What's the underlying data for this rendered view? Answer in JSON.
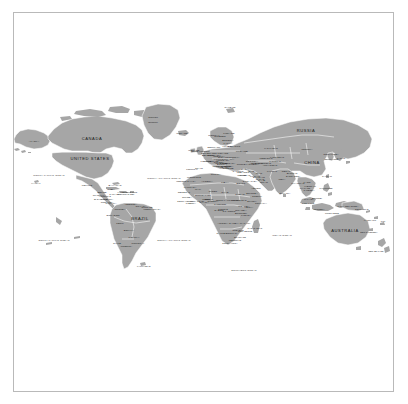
{
  "document": {
    "type": "world-political-map",
    "title": "World Map",
    "projection": "Mercator-like equirectangular"
  },
  "style": {
    "page_background": "#ffffff",
    "frame_border_color": "#b9b9b9",
    "land_fill": "#a6a6a6",
    "ocean_fill": "#ffffff",
    "country_border_color": "#ffffff",
    "label_color": "#1a1a1a"
  },
  "major_labels": [
    {
      "name": "CANADA",
      "x": 78,
      "y": 48
    },
    {
      "name": "UNITED STATES",
      "x": 76,
      "y": 68
    },
    {
      "name": "RUSSIA",
      "x": 292,
      "y": 40
    },
    {
      "name": "CHINA",
      "x": 298,
      "y": 72
    },
    {
      "name": "BRAZIL",
      "x": 126,
      "y": 128
    },
    {
      "name": "AUSTRALIA",
      "x": 331,
      "y": 140
    }
  ],
  "mid_labels": [
    {
      "name": "Greenland",
      "x": 139,
      "y": 26
    },
    {
      "name": "(Denmark)",
      "x": 139,
      "y": 31
    },
    {
      "name": "MONGOLIA",
      "x": 293,
      "y": 58
    },
    {
      "name": "KAZAKHSTAN",
      "x": 257,
      "y": 57
    },
    {
      "name": "INDIA",
      "x": 268,
      "y": 88
    },
    {
      "name": "ALGERIA",
      "x": 193,
      "y": 90
    },
    {
      "name": "LIBYA",
      "x": 211,
      "y": 91
    },
    {
      "name": "EGYPT",
      "x": 227,
      "y": 92
    },
    {
      "name": "SUDAN",
      "x": 226,
      "y": 103
    },
    {
      "name": "CHAD",
      "x": 211,
      "y": 101
    },
    {
      "name": "NIGER",
      "x": 199,
      "y": 100
    },
    {
      "name": "MALI",
      "x": 184,
      "y": 98
    },
    {
      "name": "NIGERIA",
      "x": 199,
      "y": 110
    },
    {
      "name": "ETHIOPIA",
      "x": 238,
      "y": 110
    },
    {
      "name": "D.R. CONGO",
      "x": 215,
      "y": 120
    },
    {
      "name": "ANGOLA",
      "x": 209,
      "y": 132
    },
    {
      "name": "TANZANIA",
      "x": 232,
      "y": 124
    },
    {
      "name": "ZAMBIA",
      "x": 220,
      "y": 132
    },
    {
      "name": "NAMIBIA",
      "x": 208,
      "y": 142
    },
    {
      "name": "BOTSWANA",
      "x": 218,
      "y": 142
    },
    {
      "name": "SOUTH AFRICA",
      "x": 216,
      "y": 152
    },
    {
      "name": "MADAGASCAR",
      "x": 241,
      "y": 137
    },
    {
      "name": "ARGENTINA",
      "x": 112,
      "y": 155
    },
    {
      "name": "CHILE",
      "x": 103,
      "y": 152
    },
    {
      "name": "PERU",
      "x": 106,
      "y": 132
    },
    {
      "name": "BOLIVIA",
      "x": 115,
      "y": 139
    },
    {
      "name": "COLOMBIA",
      "x": 106,
      "y": 118
    },
    {
      "name": "VENEZUELA",
      "x": 117,
      "y": 113
    },
    {
      "name": "MEXICO",
      "x": 73,
      "y": 94
    },
    {
      "name": "ALASKA",
      "x": 20,
      "y": 50
    },
    {
      "name": "IRAN",
      "x": 245,
      "y": 82
    },
    {
      "name": "SAUDI ARABIA",
      "x": 236,
      "y": 90
    },
    {
      "name": "IRAQ",
      "x": 237,
      "y": 80
    },
    {
      "name": "TURKEY",
      "x": 228,
      "y": 73
    },
    {
      "name": "PAKISTAN",
      "x": 258,
      "y": 80
    },
    {
      "name": "AFGHANISTAN",
      "x": 256,
      "y": 74
    },
    {
      "name": "INDONESIA",
      "x": 305,
      "y": 118
    },
    {
      "name": "PAPUA NEW GUINEA",
      "x": 334,
      "y": 115
    },
    {
      "name": "JAPAN",
      "x": 327,
      "y": 67
    },
    {
      "name": "THAILAND",
      "x": 291,
      "y": 97
    },
    {
      "name": "MYANMAR",
      "x": 284,
      "y": 92
    },
    {
      "name": "VIETNAM",
      "x": 296,
      "y": 95
    },
    {
      "name": "PHILIPPINES",
      "x": 312,
      "y": 97
    },
    {
      "name": "MALAYSIA",
      "x": 295,
      "y": 108
    },
    {
      "name": "NEW ZEALAND",
      "x": 362,
      "y": 160
    },
    {
      "name": "UKRAINE",
      "x": 228,
      "y": 60
    },
    {
      "name": "SPAIN",
      "x": 185,
      "y": 77
    },
    {
      "name": "FRANCE",
      "x": 192,
      "y": 70
    },
    {
      "name": "GERMANY",
      "x": 200,
      "y": 64
    },
    {
      "name": "POLAND",
      "x": 209,
      "y": 62
    },
    {
      "name": "ITALY",
      "x": 202,
      "y": 75
    },
    {
      "name": "NORWAY",
      "x": 200,
      "y": 44
    },
    {
      "name": "SWEDEN",
      "x": 206,
      "y": 45
    },
    {
      "name": "FINLAND",
      "x": 215,
      "y": 42
    },
    {
      "name": "UNITED KINGDOM",
      "x": 186,
      "y": 60
    },
    {
      "name": "ICELAND",
      "x": 168,
      "y": 42
    },
    {
      "name": "MOROCCO",
      "x": 180,
      "y": 86
    },
    {
      "name": "MAURITANIA",
      "x": 176,
      "y": 96
    },
    {
      "name": "SOMALIA",
      "x": 247,
      "y": 112
    },
    {
      "name": "KENYA",
      "x": 235,
      "y": 116
    },
    {
      "name": "MOZAMBIQUE",
      "x": 231,
      "y": 140
    },
    {
      "name": "ZIMBABWE",
      "x": 224,
      "y": 139
    },
    {
      "name": "CUBA",
      "x": 97,
      "y": 98
    },
    {
      "name": "PARAGUAY",
      "x": 120,
      "y": 146
    },
    {
      "name": "URUGUAY",
      "x": 124,
      "y": 152
    },
    {
      "name": "ECUADOR",
      "x": 99,
      "y": 124
    },
    {
      "name": "UZBEKISTAN",
      "x": 252,
      "y": 67
    },
    {
      "name": "SYRIA",
      "x": 231,
      "y": 78
    },
    {
      "name": "NEPAL",
      "x": 272,
      "y": 80
    },
    {
      "name": "BANGLADESH",
      "x": 279,
      "y": 85
    },
    {
      "name": "SRI LANKA",
      "x": 271,
      "y": 102
    },
    {
      "name": "SOUTH KOREA",
      "x": 318,
      "y": 68
    },
    {
      "name": "NORTH KOREA",
      "x": 317,
      "y": 63
    },
    {
      "name": "TAIWAN",
      "x": 313,
      "y": 85
    },
    {
      "name": "CAMEROON",
      "x": 206,
      "y": 113
    },
    {
      "name": "GHANA",
      "x": 190,
      "y": 111
    },
    {
      "name": "SENEGAL",
      "x": 170,
      "y": 101
    },
    {
      "name": "TUNISIA",
      "x": 202,
      "y": 83
    },
    {
      "name": "GREECE",
      "x": 214,
      "y": 77
    },
    {
      "name": "ROMANIA",
      "x": 214,
      "y": 68
    },
    {
      "name": "BELARUS",
      "x": 220,
      "y": 55
    },
    {
      "name": "PORTUGAL",
      "x": 178,
      "y": 78
    },
    {
      "name": "GUYANA",
      "x": 127,
      "y": 115
    },
    {
      "name": "SURINAME",
      "x": 133,
      "y": 116
    },
    {
      "name": "HONDURAS",
      "x": 91,
      "y": 105
    },
    {
      "name": "GUATEMALA",
      "x": 85,
      "y": 104
    },
    {
      "name": "NICARAGUA",
      "x": 93,
      "y": 108
    },
    {
      "name": "PANAMA",
      "x": 97,
      "y": 112
    },
    {
      "name": "COSTA RICA",
      "x": 93,
      "y": 111
    },
    {
      "name": "HAITI",
      "x": 107,
      "y": 101
    },
    {
      "name": "JAMAICA",
      "x": 101,
      "y": 103
    },
    {
      "name": "PUERTO RICO",
      "x": 116,
      "y": 101
    },
    {
      "name": "ISRAEL",
      "x": 228,
      "y": 84
    },
    {
      "name": "JORDAN",
      "x": 231,
      "y": 84
    },
    {
      "name": "OMAN",
      "x": 250,
      "y": 91
    },
    {
      "name": "YEMEN",
      "x": 242,
      "y": 97
    },
    {
      "name": "U.A.E.",
      "x": 248,
      "y": 89
    },
    {
      "name": "GEORGIA",
      "x": 238,
      "y": 70
    },
    {
      "name": "AZERBAIJAN",
      "x": 242,
      "y": 72
    },
    {
      "name": "TURKMENISTAN",
      "x": 249,
      "y": 72
    },
    {
      "name": "KYRGYZSTAN",
      "x": 263,
      "y": 66
    },
    {
      "name": "TAJIKISTAN",
      "x": 261,
      "y": 70
    },
    {
      "name": "LAOS",
      "x": 293,
      "y": 91
    },
    {
      "name": "CAMBODIA",
      "x": 295,
      "y": 99
    },
    {
      "name": "UGANDA",
      "x": 230,
      "y": 115
    },
    {
      "name": "RWANDA",
      "x": 227,
      "y": 119
    },
    {
      "name": "GABON",
      "x": 205,
      "y": 119
    },
    {
      "name": "CONGO",
      "x": 209,
      "y": 118
    },
    {
      "name": "MALAWI",
      "x": 231,
      "y": 132
    },
    {
      "name": "ERITREA",
      "x": 238,
      "y": 102
    },
    {
      "name": "BURKINA FASO",
      "x": 189,
      "y": 104
    },
    {
      "name": "IVORY COAST",
      "x": 183,
      "y": 110
    },
    {
      "name": "GUINEA",
      "x": 173,
      "y": 106
    },
    {
      "name": "LIBERIA",
      "x": 177,
      "y": 112
    },
    {
      "name": "SIERRA LEONE",
      "x": 171,
      "y": 110
    },
    {
      "name": "BENIN",
      "x": 195,
      "y": 108
    },
    {
      "name": "TOGO",
      "x": 192,
      "y": 108
    },
    {
      "name": "CENTRAL AFRICAN REP.",
      "x": 214,
      "y": 109
    },
    {
      "name": "SOUTH SUDAN",
      "x": 225,
      "y": 109
    },
    {
      "name": "DJIBOUTI",
      "x": 243,
      "y": 105
    },
    {
      "name": "BURUNDI",
      "x": 227,
      "y": 122
    },
    {
      "name": "LESOTHO",
      "x": 221,
      "y": 149
    },
    {
      "name": "SWAZILAND",
      "x": 226,
      "y": 146
    },
    {
      "name": "BELIZE",
      "x": 88,
      "y": 101
    },
    {
      "name": "EL SALVADOR",
      "x": 87,
      "y": 108
    },
    {
      "name": "DOMINICAN REP.",
      "x": 112,
      "y": 103
    },
    {
      "name": "BAHAMAS",
      "x": 101,
      "y": 94
    },
    {
      "name": "FRENCH GUIANA",
      "x": 138,
      "y": 118
    },
    {
      "name": "AUSTRIA",
      "x": 204,
      "y": 68
    },
    {
      "name": "SWITZERLAND",
      "x": 197,
      "y": 70
    },
    {
      "name": "CZECHIA",
      "x": 205,
      "y": 65
    },
    {
      "name": "HUNGARY",
      "x": 209,
      "y": 69
    },
    {
      "name": "SERBIA",
      "x": 211,
      "y": 72
    },
    {
      "name": "BULGARIA",
      "x": 216,
      "y": 72
    },
    {
      "name": "CROATIA",
      "x": 207,
      "y": 72
    },
    {
      "name": "NETHERLANDS",
      "x": 195,
      "y": 62
    },
    {
      "name": "BELGIUM",
      "x": 194,
      "y": 64
    },
    {
      "name": "DENMARK",
      "x": 200,
      "y": 56
    },
    {
      "name": "IRELAND",
      "x": 180,
      "y": 59
    },
    {
      "name": "LITHUANIA",
      "x": 214,
      "y": 55
    },
    {
      "name": "LATVIA",
      "x": 214,
      "y": 52
    },
    {
      "name": "ESTONIA",
      "x": 214,
      "y": 49
    },
    {
      "name": "SLOVAKIA",
      "x": 209,
      "y": 66
    },
    {
      "name": "MOLDOVA",
      "x": 219,
      "y": 66
    },
    {
      "name": "ALBANIA",
      "x": 210,
      "y": 76
    },
    {
      "name": "MACEDONIA",
      "x": 213,
      "y": 75
    },
    {
      "name": "CYPRUS",
      "x": 224,
      "y": 80
    },
    {
      "name": "LEBANON",
      "x": 229,
      "y": 81
    },
    {
      "name": "KUWAIT",
      "x": 241,
      "y": 85
    },
    {
      "name": "QATAR",
      "x": 246,
      "y": 88
    },
    {
      "name": "BAHRAIN",
      "x": 245,
      "y": 86
    },
    {
      "name": "ARMENIA",
      "x": 239,
      "y": 73
    },
    {
      "name": "BHUTAN",
      "x": 278,
      "y": 82
    },
    {
      "name": "FIJI",
      "x": 369,
      "y": 130
    },
    {
      "name": "NEW CALEDONIA",
      "x": 355,
      "y": 141
    },
    {
      "name": "SOLOMON IS.",
      "x": 348,
      "y": 118
    },
    {
      "name": "VANUATU",
      "x": 356,
      "y": 129
    },
    {
      "name": "HAWAII",
      "x": 22,
      "y": 92
    },
    {
      "name": "FALKLAND IS.",
      "x": 130,
      "y": 175
    },
    {
      "name": "SVALBARD",
      "x": 216,
      "y": 16
    },
    {
      "name": "WESTERN SAHARA",
      "x": 172,
      "y": 90
    },
    {
      "name": "TIMOR-LESTE",
      "x": 318,
      "y": 122
    },
    {
      "name": "BRUNEI",
      "x": 303,
      "y": 107
    },
    {
      "name": "SINGAPORE",
      "x": 294,
      "y": 112
    },
    {
      "name": "SLOVENIA",
      "x": 205,
      "y": 71
    },
    {
      "name": "BOSNIA",
      "x": 208,
      "y": 73
    },
    {
      "name": "MONTENEGRO",
      "x": 209,
      "y": 75
    }
  ],
  "ocean_labels": [
    {
      "name": "NORTH PACIFIC OCEAN",
      "x": 35,
      "y": 85
    },
    {
      "name": "SOUTH PACIFIC OCEAN",
      "x": 40,
      "y": 150
    },
    {
      "name": "NORTH ATLANTIC OCEAN",
      "x": 150,
      "y": 88
    },
    {
      "name": "SOUTH ATLANTIC OCEAN",
      "x": 160,
      "y": 150
    },
    {
      "name": "INDIAN OCEAN",
      "x": 268,
      "y": 145
    },
    {
      "name": "ARCTIC OCEAN",
      "x": 170,
      "y": 10
    },
    {
      "name": "SOUTHERN OCEAN",
      "x": 230,
      "y": 180
    }
  ]
}
